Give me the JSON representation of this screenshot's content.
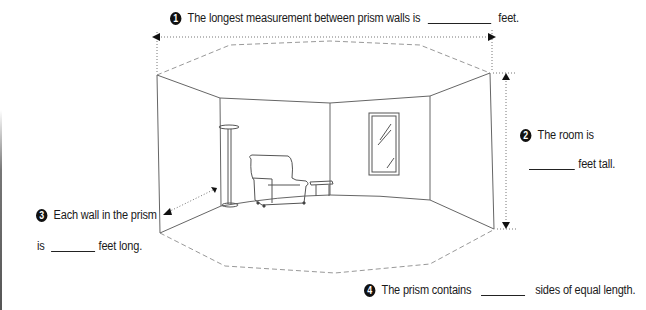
{
  "questions": [
    {
      "number": "1",
      "text_before": "The longest measurement between prism walls is",
      "text_after": "feet."
    },
    {
      "number": "2",
      "text_before": "The room is",
      "text_after": "feet tall."
    },
    {
      "number": "3",
      "text_before": "Each wall in the prism",
      "text_line2_before": "is",
      "text_after": "feet long."
    },
    {
      "number": "4",
      "text_before": "The prism contains",
      "text_after": "sides of equal length."
    }
  ],
  "illustration": {
    "subject": "octagonal-prism-room",
    "objects": [
      "floor-lamp",
      "armchair",
      "side-table",
      "window"
    ],
    "line_color": "#555555",
    "dash_color": "#888888"
  }
}
